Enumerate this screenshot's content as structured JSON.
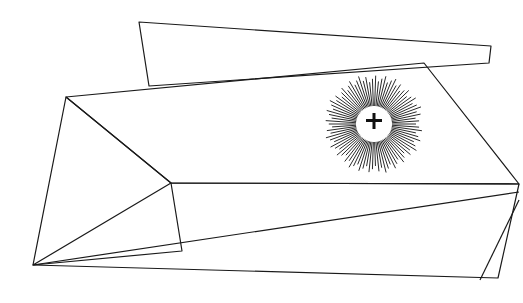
{
  "artwork": {
    "title": "Abstract geometric line drawing with radiating sunburst",
    "background": "#ffffff",
    "stroke_color": "#1a1a1a",
    "sunburst": {
      "center": [
        374,
        124
      ],
      "inner_radius": 18,
      "outer_radius": 46,
      "ray_count": 90,
      "center_mark": "small dark geometric emblem"
    }
  }
}
